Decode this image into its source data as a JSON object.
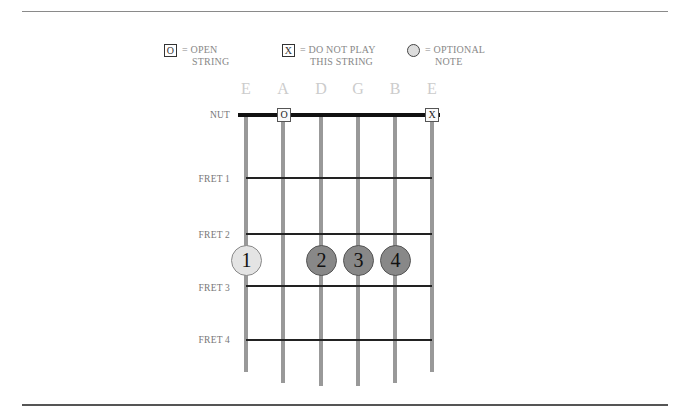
{
  "legend": {
    "open": {
      "symbol": "O",
      "line1": "= OPEN",
      "line2": "STRING"
    },
    "mute": {
      "symbol": "X",
      "line1": "= DO NOT PLAY",
      "line2": "THIS STRING"
    },
    "optional": {
      "line1": "= OPTIONAL",
      "line2": "NOTE"
    }
  },
  "strings": [
    {
      "name": "E",
      "x": 246,
      "end": 372
    },
    {
      "name": "A",
      "x": 283,
      "end": 383
    },
    {
      "name": "D",
      "x": 321,
      "end": 386
    },
    {
      "name": "G",
      "x": 358,
      "end": 386
    },
    {
      "name": "B",
      "x": 395,
      "end": 383
    },
    {
      "name": "E",
      "x": 432,
      "end": 372
    }
  ],
  "labels": {
    "nut": "NUT",
    "fret1": "FRET 1",
    "fret2": "FRET 2",
    "fret3": "FRET 3",
    "fret4": "FRET 4"
  },
  "markers": [
    {
      "string": "A",
      "symbol": "O"
    },
    {
      "string": "E-high",
      "symbol": "X"
    }
  ],
  "fingers": [
    {
      "string": "E",
      "fret": 2.5,
      "label": "1",
      "type": "optional"
    },
    {
      "string": "D",
      "fret": 2.5,
      "label": "2",
      "type": "finger"
    },
    {
      "string": "G",
      "fret": 2.5,
      "label": "3",
      "type": "finger"
    },
    {
      "string": "B",
      "fret": 2.5,
      "label": "4",
      "type": "finger"
    }
  ],
  "colors": {
    "optional_fill": "#e4e4e4",
    "finger_fill": "#888888",
    "string": "#999999",
    "fret": "#222222"
  }
}
